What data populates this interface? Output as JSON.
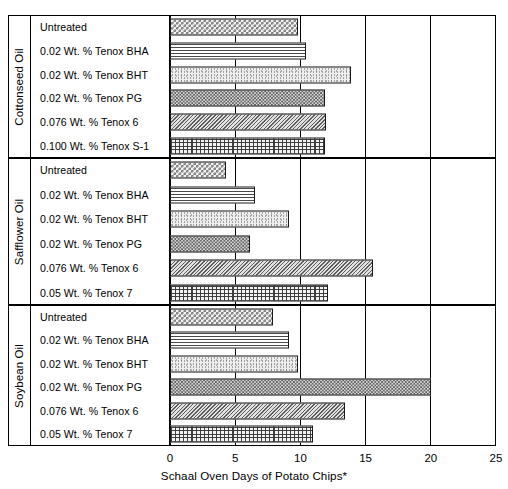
{
  "chart_data": {
    "type": "bar",
    "orientation": "horizontal",
    "title": "",
    "xlabel": "Schaal Oven Days of Potato Chips*",
    "ylabel": "",
    "xlim": [
      0,
      25
    ],
    "xticks": [
      0,
      5,
      10,
      15,
      20,
      25
    ],
    "xtick_labels": [
      "0",
      "5",
      "10",
      "15",
      "20",
      "25"
    ],
    "grid": true,
    "legend": "none",
    "groups": [
      {
        "name": "Cottonseed Oil",
        "categories": [
          "Untreated",
          "0.02 Wt. % Tenox BHA",
          "0.02 Wt. % Tenox BHT",
          "0.02 Wt. % Tenox PG",
          "0.076 Wt. % Tenox 6",
          "0.100 Wt. % Tenox S-1"
        ],
        "values": [
          9.8,
          10.4,
          13.9,
          11.9,
          12.0,
          11.9
        ],
        "patterns": [
          "checker-coarse",
          "hlines",
          "stipple",
          "checker-fine",
          "diag",
          "grid"
        ]
      },
      {
        "name": "Safflower Oil",
        "categories": [
          "Untreated",
          "0.02 Wt. % Tenox BHA",
          "0.02 Wt. % Tenox BHT",
          "0.02 Wt. % Tenox PG",
          "0.076 Wt. % Tenox 6",
          "0.05 Wt. % Tenox 7"
        ],
        "values": [
          4.3,
          6.5,
          9.1,
          6.1,
          15.6,
          12.1
        ],
        "patterns": [
          "checker-coarse",
          "hlines",
          "stipple",
          "checker-fine",
          "diag",
          "grid"
        ]
      },
      {
        "name": "Soybean Oil",
        "categories": [
          "Untreated",
          "0.02 Wt. % Tenox BHA",
          "0.02 Wt. % Tenox BHT",
          "0.02 Wt. % Tenox PG",
          "0.076 Wt. % Tenox 6",
          "0.05 Wt. % Tenox 7"
        ],
        "values": [
          7.9,
          9.1,
          9.8,
          20.0,
          13.4,
          11.0
        ],
        "patterns": [
          "checker-coarse",
          "hlines",
          "stipple",
          "checker-fine",
          "diag",
          "grid"
        ]
      }
    ]
  },
  "colors": {
    "frame": "#000000",
    "background": "#ffffff",
    "bar_outline": "#1a1a1a"
  }
}
